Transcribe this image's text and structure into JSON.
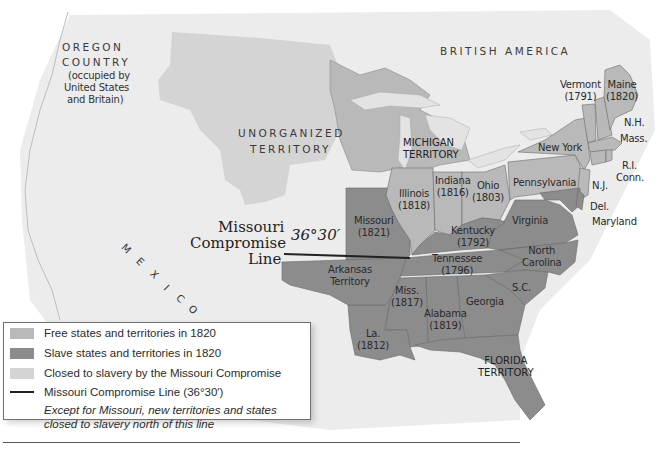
{
  "map": {
    "title": "Missouri Compromise, 1820",
    "colors": {
      "background": "#f1f1f1",
      "free": "#b9b9b9",
      "slave": "#8c8c8c",
      "closed": "#d4d4d4",
      "water": "#e3e3e3",
      "line": "#222222",
      "border": "#6a6a6a"
    },
    "region_labels": {
      "oregon": [
        "OREGON",
        "COUNTRY",
        "(occupied by",
        "United States",
        "and Britain)"
      ],
      "british_america": "BRITISH AMERICA",
      "unorganized": [
        "UNORGANIZED",
        "TERRITORY"
      ],
      "michigan": [
        "MICHIGAN",
        "TERRITORY"
      ],
      "mexico": [
        "M",
        "E",
        "X",
        "I",
        "C",
        "O"
      ],
      "florida": [
        "FLORIDA",
        "TERRITORY"
      ],
      "arkansas": [
        "Arkansas",
        "Territory"
      ]
    },
    "compromise_label": [
      "Missouri",
      "Compromise",
      "Line"
    ],
    "compromise_degree": "36°30′",
    "states": [
      {
        "id": "maine",
        "name": "Maine",
        "year": "(1820)",
        "status": "free"
      },
      {
        "id": "vermont",
        "name": "Vermont",
        "year": "(1791)",
        "status": "free"
      },
      {
        "id": "nh",
        "name": "N.H.",
        "year": "",
        "status": "free"
      },
      {
        "id": "mass",
        "name": "Mass.",
        "year": "",
        "status": "free"
      },
      {
        "id": "ri",
        "name": "R.I.",
        "year": "",
        "status": "free"
      },
      {
        "id": "conn",
        "name": "Conn.",
        "year": "",
        "status": "free"
      },
      {
        "id": "ny",
        "name": "New York",
        "year": "",
        "status": "free"
      },
      {
        "id": "nj",
        "name": "N.J.",
        "year": "",
        "status": "free"
      },
      {
        "id": "penn",
        "name": "Pennsylvania",
        "year": "",
        "status": "free"
      },
      {
        "id": "del",
        "name": "Del.",
        "year": "",
        "status": "slave"
      },
      {
        "id": "md",
        "name": "Maryland",
        "year": "",
        "status": "slave"
      },
      {
        "id": "ohio",
        "name": "Ohio",
        "year": "(1803)",
        "status": "free"
      },
      {
        "id": "indiana",
        "name": "Indiana",
        "year": "(1816)",
        "status": "free"
      },
      {
        "id": "illinois",
        "name": "Illinois",
        "year": "(1818)",
        "status": "free"
      },
      {
        "id": "missouri",
        "name": "Missouri",
        "year": "(1821)",
        "status": "slave"
      },
      {
        "id": "kentucky",
        "name": "Kentucky",
        "year": "(1792)",
        "status": "slave"
      },
      {
        "id": "virginia",
        "name": "Virginia",
        "year": "",
        "status": "slave"
      },
      {
        "id": "nc",
        "name": "North",
        "year": "Carolina",
        "status": "slave"
      },
      {
        "id": "tennessee",
        "name": "Tennessee",
        "year": "(1796)",
        "status": "slave"
      },
      {
        "id": "sc",
        "name": "S.C.",
        "year": "",
        "status": "slave"
      },
      {
        "id": "georgia",
        "name": "Georgia",
        "year": "",
        "status": "slave"
      },
      {
        "id": "alabama",
        "name": "Alabama",
        "year": "(1819)",
        "status": "slave"
      },
      {
        "id": "miss",
        "name": "Miss.",
        "year": "(1817)",
        "status": "slave"
      },
      {
        "id": "la",
        "name": "La.",
        "year": "(1812)",
        "status": "slave"
      }
    ]
  },
  "legend": {
    "items": [
      {
        "label": "Free states and territories in 1820",
        "color": "#b9b9b9"
      },
      {
        "label": "Slave states and territories in 1820",
        "color": "#8c8c8c"
      },
      {
        "label": "Closed to slavery by the Missouri Compromise",
        "color": "#d4d4d4"
      }
    ],
    "line_label": "Missouri Compromise Line (36°30′)",
    "note_line1": "Except for Missouri, new territories and states",
    "note_line2": "closed to slavery north of this line"
  }
}
